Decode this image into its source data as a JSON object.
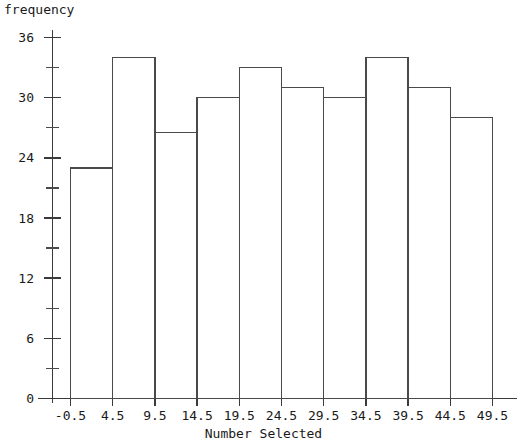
{
  "chart_data": {
    "type": "bar",
    "title": "",
    "xlabel": "Number Selected",
    "ylabel": "frequency",
    "categories": [
      "-0.5",
      "4.5",
      "9.5",
      "14.5",
      "19.5",
      "24.5",
      "29.5",
      "34.5",
      "39.5",
      "44.5"
    ],
    "bin_edges": [
      -0.5,
      4.5,
      9.5,
      14.5,
      19.5,
      24.5,
      29.5,
      34.5,
      39.5,
      44.5,
      49.5
    ],
    "values": [
      23,
      34,
      26.5,
      30,
      33,
      31,
      30,
      34,
      31,
      28
    ],
    "xtick_labels": [
      "-0.5",
      "4.5",
      "9.5",
      "14.5",
      "19.5",
      "24.5",
      "29.5",
      "34.5",
      "39.5",
      "44.5",
      "49.5"
    ],
    "ytick_labels": [
      "0",
      "6",
      "12",
      "18",
      "24",
      "30",
      "36"
    ],
    "ytick_values": [
      0,
      6,
      12,
      18,
      24,
      30,
      36
    ],
    "yminor_values": [
      3,
      9,
      15,
      21,
      27,
      33
    ],
    "ylim": [
      0,
      36
    ],
    "xlim": [
      -0.5,
      49.5
    ],
    "grid": false,
    "legend": null,
    "bar_edge_color": "#4a4a4a",
    "bar_fill_color": "#ffffff",
    "axis_color": "#3a3a3a"
  }
}
